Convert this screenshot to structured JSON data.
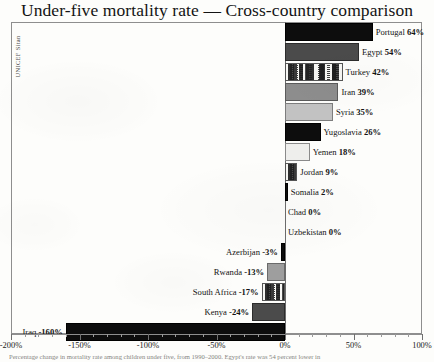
{
  "title": "Under-five mortality rate — Cross-country comparison",
  "source_label": "UNICEF Sitan",
  "caption": "Percentage change in mortality rate among children under five, from 1990–2000. Egypt's rate was 54 percent lower in",
  "axis": {
    "ticks": [
      "-200%",
      "-150%",
      "-100%",
      "-50%",
      "0%",
      "50%",
      "100%"
    ],
    "min": -200,
    "max": 100,
    "step": 50
  },
  "bars": [
    {
      "country": "Portugal",
      "value": 64,
      "label": "Portugal",
      "value_label": "64%",
      "fill": "f-black"
    },
    {
      "country": "Egypt",
      "value": 54,
      "label": "Egypt",
      "value_label": "54%",
      "fill": "f-darkgray"
    },
    {
      "country": "Turkey",
      "value": 42,
      "label": "Turkey",
      "value_label": "42%",
      "fill": "f-speckle"
    },
    {
      "country": "Iran",
      "value": 39,
      "label": "Iran",
      "value_label": "39%",
      "fill": "f-midgray"
    },
    {
      "country": "Syria",
      "value": 35,
      "label": "Syria",
      "value_label": "35%",
      "fill": "f-litegray"
    },
    {
      "country": "Yugoslavia",
      "value": 26,
      "label": "Yugoslavia",
      "value_label": "26%",
      "fill": "f-black"
    },
    {
      "country": "Yemen",
      "value": 18,
      "label": "Yemen",
      "value_label": "18%",
      "fill": "f-verylite"
    },
    {
      "country": "Jordan",
      "value": 9,
      "label": "Jordan",
      "value_label": "9%",
      "fill": "f-speckle"
    },
    {
      "country": "Somalia",
      "value": 2,
      "label": "Somalia",
      "value_label": "2%",
      "fill": "f-black"
    },
    {
      "country": "Chad",
      "value": 0,
      "label": "Chad",
      "value_label": "0%",
      "fill": "f-none"
    },
    {
      "country": "Uzbekistan",
      "value": 0,
      "label": "Uzbekistan",
      "value_label": "0%",
      "fill": "f-none"
    },
    {
      "country": "Azerbijan",
      "value": -3,
      "label": "Azerbijan",
      "value_label": "-3%",
      "fill": "f-black"
    },
    {
      "country": "Rwanda",
      "value": -13,
      "label": "Rwanda",
      "value_label": "-13%",
      "fill": "f-gray"
    },
    {
      "country": "South Africa",
      "value": -17,
      "label": "South Africa",
      "value_label": "-17%",
      "fill": "f-speckle"
    },
    {
      "country": "Kenya",
      "value": -24,
      "label": "Kenya",
      "value_label": "-24%",
      "fill": "f-darkgray"
    },
    {
      "country": "Iraq",
      "value": -160,
      "label": "Iraq",
      "value_label": "-160%",
      "fill": "f-black"
    }
  ],
  "chart_data": {
    "type": "bar",
    "orientation": "horizontal",
    "title": "Under-five mortality rate — Cross-country comparison",
    "xlabel": "",
    "ylabel": "",
    "xlim": [
      -200,
      100
    ],
    "grid": false,
    "legend": "none",
    "source": "UNICEF Sitan",
    "categories": [
      "Portugal",
      "Egypt",
      "Turkey",
      "Iran",
      "Syria",
      "Yugoslavia",
      "Yemen",
      "Jordan",
      "Somalia",
      "Chad",
      "Uzbekistan",
      "Azerbijan",
      "Rwanda",
      "South Africa",
      "Kenya",
      "Iraq"
    ],
    "values": [
      64,
      54,
      42,
      39,
      35,
      26,
      18,
      9,
      2,
      0,
      0,
      -3,
      -13,
      -17,
      -24,
      -160
    ],
    "tick_labels": [
      "-200%",
      "-150%",
      "-100%",
      "-50%",
      "0%",
      "50%",
      "100%"
    ],
    "annotations": [
      "Percentage change in mortality rate among children under five, from 1990–2000. Egypt's rate was 54 percent lower in"
    ]
  }
}
